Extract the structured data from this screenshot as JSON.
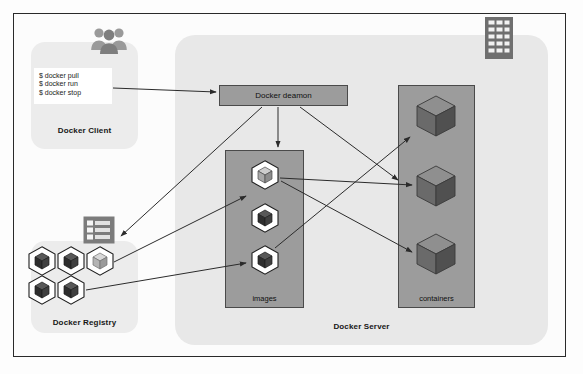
{
  "diagram": {
    "colors": {
      "frame_border": "#2a2a2a",
      "panel_light": "#ececec",
      "panel_server": "#e8e8e8",
      "box_fill": "#9c9c9c",
      "box_border": "#4a4a4a",
      "arrow": "#2b2b2b",
      "cube_dark": "#3a3a3a",
      "cube_light": "#cfcfcf",
      "icon_gray": "#8c8c8c",
      "text": "#101010"
    }
  },
  "client": {
    "label": "Docker Client",
    "users_icon": "users-icon",
    "commands": [
      "$ docker pull",
      "$ docker run",
      "$ docker stop"
    ]
  },
  "registry": {
    "label": "Docker Registry",
    "list_icon": "registry-list-icon",
    "cubes": [
      {
        "name": "registry-image-cube",
        "tone": "dark"
      },
      {
        "name": "registry-image-cube",
        "tone": "dark"
      },
      {
        "name": "registry-image-cube",
        "tone": "light"
      },
      {
        "name": "registry-image-cube",
        "tone": "dark"
      },
      {
        "name": "registry-image-cube",
        "tone": "dark"
      }
    ]
  },
  "server": {
    "label": "Docker Server",
    "building_icon": "server-building-icon",
    "daemon": {
      "label": "Docker deamon"
    },
    "images": {
      "label": "images",
      "cubes": [
        {
          "name": "image-cube",
          "tone": "light"
        },
        {
          "name": "image-cube",
          "tone": "dark"
        },
        {
          "name": "image-cube",
          "tone": "dark"
        }
      ]
    },
    "containers": {
      "label": "containers",
      "cubes": [
        {
          "name": "container-cube"
        },
        {
          "name": "container-cube"
        },
        {
          "name": "container-cube"
        }
      ]
    }
  },
  "connections": [
    {
      "name": "client-to-daemon",
      "from": "docker-client-commands",
      "to": "docker-daemon"
    },
    {
      "name": "daemon-to-registry",
      "from": "docker-daemon",
      "to": "docker-registry-list"
    },
    {
      "name": "daemon-to-images",
      "from": "docker-daemon",
      "to": "images-store"
    },
    {
      "name": "daemon-to-container-1",
      "from": "docker-daemon",
      "to": "container-cube-1"
    },
    {
      "name": "registry-to-image-0",
      "from": "registry-image-cube-2",
      "to": "image-cube-0"
    },
    {
      "name": "registry-to-image-2",
      "from": "registry-image-cube-4",
      "to": "image-cube-2"
    },
    {
      "name": "image-0-to-container-1",
      "from": "image-cube-0",
      "to": "container-cube-1"
    },
    {
      "name": "image-0-to-container-2",
      "from": "image-cube-0",
      "to": "container-cube-2"
    },
    {
      "name": "image-2-to-container-0",
      "from": "image-cube-2",
      "to": "container-cube-0"
    }
  ]
}
